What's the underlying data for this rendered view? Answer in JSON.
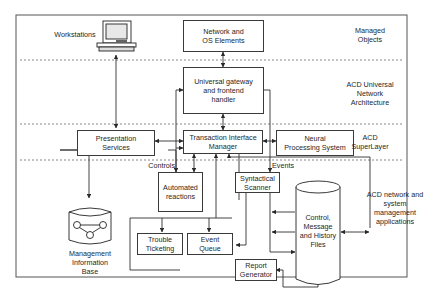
{
  "diagram": {
    "layers": [
      {
        "id": "managed-objects",
        "label": "Managed\nObjects"
      },
      {
        "id": "universal-network-architecture",
        "label": "ACD Universal\nNetwork\nArchitecture"
      },
      {
        "id": "superlayer",
        "label": "ACD\nSuperLayer"
      },
      {
        "id": "network-system-management",
        "label": "ACD network and\nsystem\nmanagement\napplications"
      }
    ],
    "nodes": {
      "workstations": "Workstations",
      "network_os": "Network and\nOS Elements",
      "universal_gateway": "Universal gateway\nand frontend\nhandler",
      "presentation": "Presentation\nServices",
      "tim": "Transaction Interface\nManager",
      "neural": "Neural\nProcessing System",
      "automated": "Automated\nreactions",
      "syntactical": "Syntactical\nScanner",
      "trouble": "Trouble\nTicketing",
      "event_queue": "Event\nQueue",
      "control_files": "Control,\nMessage\nand History\nFiles",
      "report": "Report\nGenerator",
      "mib": "Management\nInformation\nBase"
    },
    "edge_labels": {
      "controls": "Controls",
      "events": "Events"
    },
    "colors": {
      "line": "#3a3a3a",
      "dotted": "#6a6a6a",
      "frame": "#555555"
    }
  }
}
